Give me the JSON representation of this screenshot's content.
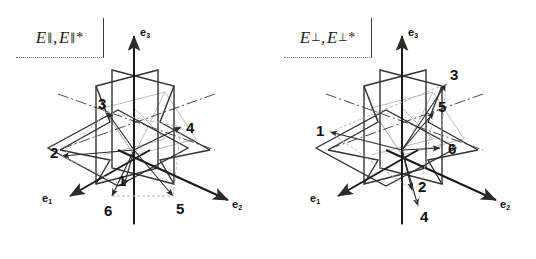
{
  "figure": {
    "background_color": "#ffffff",
    "line_color": "#333333",
    "hidden_line_color": "#b9b9b9",
    "axis_color": "#111111"
  },
  "panels": [
    {
      "id": "left",
      "label": {
        "symbol": "E",
        "subscript": "∥",
        "comma": ",",
        "symbol2": "E",
        "subscript2": "∥",
        "star": "*",
        "full_text": "E∥, E∥*"
      },
      "axes": [
        {
          "name": "e3",
          "base": "e",
          "sub": "3",
          "position": "top"
        },
        {
          "name": "e1",
          "base": "e",
          "sub": "1",
          "position": "lower-left"
        },
        {
          "name": "e2",
          "base": "e",
          "sub": "2",
          "position": "lower-right"
        }
      ],
      "vectors": [
        {
          "label": "1",
          "direction": "down-inner",
          "position": "center-lower-left"
        },
        {
          "label": "2",
          "direction": "left",
          "position": "mid-left"
        },
        {
          "label": "3",
          "direction": "upper-left",
          "position": "upper-left"
        },
        {
          "label": "4",
          "direction": "right",
          "position": "mid-right"
        },
        {
          "label": "5",
          "direction": "down-right",
          "position": "bottom-right"
        },
        {
          "label": "6",
          "direction": "down-left",
          "position": "bottom-left"
        }
      ]
    },
    {
      "id": "right",
      "label": {
        "symbol": "E",
        "subscript": "⊥",
        "comma": ",",
        "symbol2": "E",
        "subscript2": "⊥",
        "star": "*",
        "full_text": "E⊥, E⊥*"
      },
      "axes": [
        {
          "name": "e3",
          "base": "e",
          "sub": "3",
          "position": "top"
        },
        {
          "name": "e1",
          "base": "e",
          "sub": "1",
          "position": "lower-left"
        },
        {
          "name": "e2",
          "base": "e",
          "sub": "2",
          "position": "lower-right"
        }
      ],
      "vectors": [
        {
          "label": "1",
          "direction": "left",
          "position": "mid-left"
        },
        {
          "label": "2",
          "direction": "down-inner",
          "position": "center-lower"
        },
        {
          "label": "3",
          "direction": "upper-right",
          "position": "upper-right"
        },
        {
          "label": "4",
          "direction": "down",
          "position": "bottom-center"
        },
        {
          "label": "5",
          "direction": "upper-right-inner",
          "position": "upper-right-inner"
        },
        {
          "label": "6",
          "direction": "right",
          "position": "mid-right"
        }
      ]
    }
  ]
}
